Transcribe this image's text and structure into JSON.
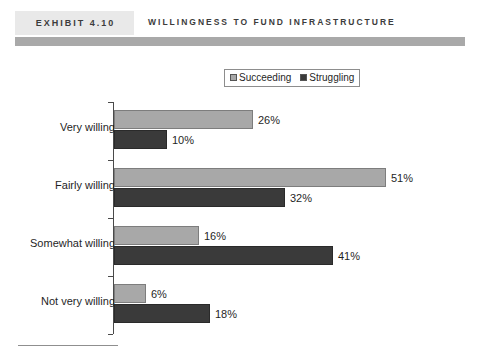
{
  "header": {
    "exhibit_tag": "EXHIBIT 4.10",
    "title": "WILLINGNESS TO FUND INFRASTRUCTURE"
  },
  "legend": {
    "position": "top-center",
    "entries": [
      {
        "label": "Succeeding",
        "swatch": "light-gray-square-icon",
        "color": "#a8a8a8"
      },
      {
        "label": "Struggling",
        "swatch": "dark-gray-square-icon",
        "color": "#3a3a3a"
      }
    ]
  },
  "chart_data": {
    "type": "bar",
    "orientation": "horizontal",
    "title": "WILLINGNESS TO FUND INFRASTRUCTURE",
    "xlabel": "",
    "ylabel": "",
    "xlim": [
      0,
      55
    ],
    "grid": false,
    "legend_position": "top-center",
    "categories": [
      "Very willing",
      "Fairly willing",
      "Somewhat willing",
      "Not very willing"
    ],
    "series": [
      {
        "name": "Succeeding",
        "color": "#a8a8a8",
        "values": [
          26,
          51,
          16,
          6
        ],
        "labels": [
          "26%",
          "51%",
          "16%",
          "6%"
        ]
      },
      {
        "name": "Struggling",
        "color": "#3a3a3a",
        "values": [
          10,
          32,
          41,
          18
        ],
        "labels": [
          "10%",
          "32%",
          "41%",
          "18%"
        ]
      }
    ]
  },
  "scale": {
    "px_per_percent": 5.33
  }
}
